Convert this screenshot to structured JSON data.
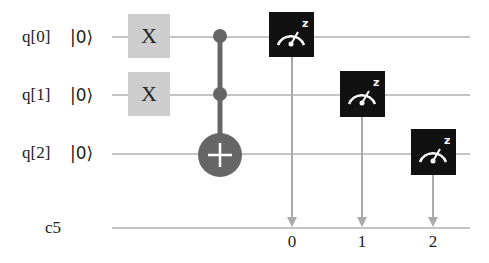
{
  "circuit": {
    "qubits": [
      {
        "label": "q[0]",
        "init": "|0⟩"
      },
      {
        "label": "q[1]",
        "init": "|0⟩"
      },
      {
        "label": "q[2]",
        "init": "|0⟩"
      }
    ],
    "classical_register": {
      "label": "c5",
      "bits": [
        "0",
        "1",
        "2"
      ]
    },
    "gates": [
      {
        "type": "X",
        "label": "X",
        "qubit": 0
      },
      {
        "type": "X",
        "label": "X",
        "qubit": 1
      },
      {
        "type": "CCX",
        "controls": [
          0,
          1
        ],
        "target": 2
      },
      {
        "type": "measure",
        "basis": "z",
        "qubit": 0,
        "cbit": 0
      },
      {
        "type": "measure",
        "basis": "z",
        "qubit": 1,
        "cbit": 1
      },
      {
        "type": "measure",
        "basis": "z",
        "qubit": 2,
        "cbit": 2
      }
    ],
    "colors": {
      "wire": "#c4c4c4",
      "x_gate": "#cdcdcd",
      "control": "#666666",
      "measure_box": "#111111"
    }
  }
}
